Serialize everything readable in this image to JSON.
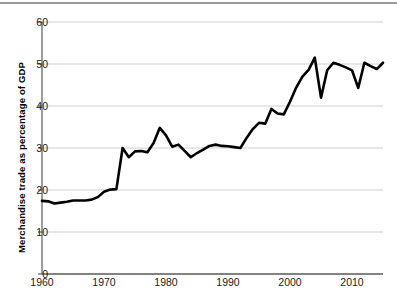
{
  "chart_data": {
    "type": "line",
    "title": "",
    "xlabel": "",
    "ylabel": "Merchandise trade as percentage of GDP",
    "xlim": [
      1960,
      2015
    ],
    "ylim": [
      0,
      60
    ],
    "yticks": [
      0,
      10,
      20,
      30,
      40,
      50,
      60
    ],
    "xticks": [
      1960,
      1970,
      1980,
      1990,
      2000,
      2010
    ],
    "ytick_labels": [
      "0",
      "10",
      "20",
      "30",
      "40",
      "50",
      "60"
    ],
    "xtick_labels": [
      "1960",
      "1970",
      "1980",
      "1990",
      "2000",
      "2010"
    ],
    "grid": "horizontal",
    "legend": "none",
    "line_color": "#000000",
    "line_width": 2.6,
    "gridline_color": "#cfcfcf",
    "axis_color": "#5a5a5a",
    "series": [
      {
        "name": "Merchandise trade as percentage of GDP",
        "x": [
          1960,
          1961,
          1962,
          1963,
          1964,
          1965,
          1966,
          1967,
          1968,
          1969,
          1970,
          1971,
          1972,
          1973,
          1974,
          1975,
          1976,
          1977,
          1978,
          1979,
          1980,
          1981,
          1982,
          1983,
          1984,
          1985,
          1986,
          1987,
          1988,
          1989,
          1990,
          1991,
          1992,
          1993,
          1994,
          1995,
          1996,
          1997,
          1998,
          1999,
          2000,
          2001,
          2002,
          2003,
          2004,
          2005,
          2006,
          2007,
          2008,
          2009,
          2010,
          2011,
          2012,
          2013,
          2014,
          2015
        ],
        "values": [
          17.4,
          17.3,
          16.8,
          17.0,
          17.2,
          17.5,
          17.5,
          17.5,
          17.7,
          18.3,
          19.6,
          20.1,
          20.2,
          30.0,
          27.8,
          29.2,
          29.3,
          29.0,
          31.2,
          34.8,
          33.0,
          30.3,
          30.8,
          29.3,
          27.8,
          28.8,
          29.6,
          30.5,
          30.8,
          30.5,
          30.4,
          30.2,
          30.0,
          32.4,
          34.5,
          36.0,
          35.8,
          39.3,
          38.2,
          38.0,
          41.0,
          44.4,
          47.0,
          48.6,
          51.5,
          42.0,
          48.5,
          50.3,
          49.8,
          49.2,
          48.5,
          44.3,
          50.3,
          49.5,
          48.8,
          50.3
        ]
      }
    ]
  },
  "axis": {
    "y_title": "Merchandise trade as percentage of GDP"
  }
}
